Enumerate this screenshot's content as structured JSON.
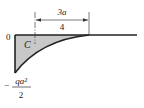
{
  "diagram": {
    "type": "bending-moment-diagram",
    "origin_label": "0",
    "point_label": "C",
    "dimension": {
      "numerator": "3a",
      "denominator": "4"
    },
    "min_moment_label": {
      "sign": "−",
      "numerator": "qa²",
      "denominator": "2"
    },
    "colors": {
      "fill": "#c8c8c8",
      "line": "#222222",
      "text": "#222222"
    }
  }
}
